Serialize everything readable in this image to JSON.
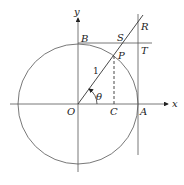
{
  "diagram": {
    "axes": {
      "x_label": "x",
      "y_label": "y"
    },
    "points": {
      "O": "O",
      "A": "A",
      "B": "B",
      "C": "C",
      "P": "P",
      "S": "S",
      "T": "T",
      "R": "R"
    },
    "radius_label": "1",
    "angle_label": "θ",
    "colors": {
      "stroke": "#555555",
      "text": "#222222"
    }
  }
}
